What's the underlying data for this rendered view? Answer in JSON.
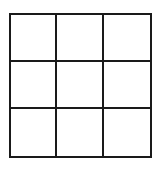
{
  "grid": {
    "rows": 3,
    "columns": 3,
    "line_color": "#1a1a1a",
    "background": "#ffffff",
    "cells": [
      [
        "",
        "",
        ""
      ],
      [
        "",
        "",
        ""
      ],
      [
        "",
        "",
        ""
      ]
    ]
  }
}
